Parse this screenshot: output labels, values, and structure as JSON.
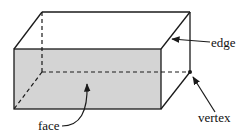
{
  "diagram": {
    "shape": "rectangular-prism",
    "colors": {
      "face_fill": "#d4d4d4",
      "line": "#1a1a1a",
      "background": "#ffffff"
    },
    "labels": {
      "edge": "edge",
      "vertex": "vertex",
      "face": "face"
    }
  }
}
